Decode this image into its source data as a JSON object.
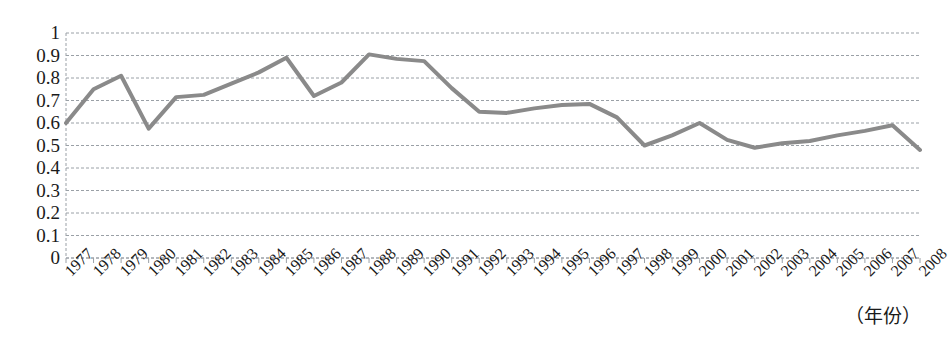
{
  "chart_data": {
    "type": "line",
    "title": "",
    "subtitle": "",
    "xlabel": "（年份）",
    "ylabel": "",
    "xlim": [
      1977,
      2008
    ],
    "ylim": [
      0,
      1
    ],
    "grid": true,
    "grid_style": "dashed-horizontal",
    "legend": "none",
    "line_color": "#8a8a8a",
    "line_width": 4,
    "markers": "none",
    "categories": [
      "1977",
      "1978",
      "1979",
      "1980",
      "1981",
      "1982",
      "1983",
      "1984",
      "1985",
      "1986",
      "1987",
      "1988",
      "1989",
      "1990",
      "1991",
      "1992",
      "1993",
      "1994",
      "1995",
      "1996",
      "1997",
      "1998",
      "1999",
      "2000",
      "2001",
      "2002",
      "2003",
      "2004",
      "2005",
      "2006",
      "2007",
      "2008"
    ],
    "values": [
      0.6,
      0.75,
      0.81,
      0.575,
      0.715,
      0.725,
      0.775,
      0.825,
      0.89,
      0.72,
      0.78,
      0.905,
      0.885,
      0.875,
      0.755,
      0.65,
      0.645,
      0.665,
      0.68,
      0.685,
      0.625,
      0.5,
      0.545,
      0.6,
      0.525,
      0.49,
      0.51,
      0.52,
      0.545,
      0.565,
      0.59,
      0.48
    ],
    "y_ticks": [
      "0",
      "0.1",
      "0.2",
      "0.3",
      "0.4",
      "0.5",
      "0.6",
      "0.7",
      "0.8",
      "0.9",
      "1"
    ],
    "y_tick_values": [
      0,
      0.1,
      0.2,
      0.3,
      0.4,
      0.5,
      0.6,
      0.7,
      0.8,
      0.9,
      1
    ]
  },
  "axes": {
    "x_axis_title": "（年份）"
  }
}
